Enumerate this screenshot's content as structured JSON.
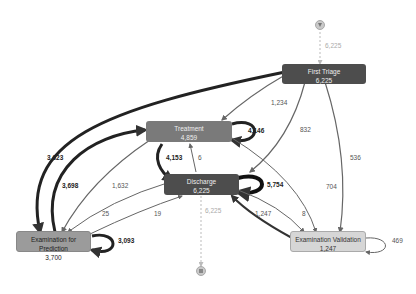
{
  "start": {
    "icon": "start-filter-icon",
    "count": "6,225"
  },
  "end": {
    "icon": "end-stop-icon",
    "count": "6,225"
  },
  "nodes": {
    "first_triage": {
      "label": "First Triage",
      "count": "6,225",
      "color": "#4d4d4d"
    },
    "treatment": {
      "label": "Treatment",
      "count": "4,859",
      "color": "#7a7a7a"
    },
    "discharge": {
      "label": "Discharge",
      "count": "6,225",
      "color": "#4d4d4d"
    },
    "exam_prediction": {
      "label": "Examination for Prediction",
      "count": "3,700",
      "color": "#9b9b9b"
    },
    "exam_validation": {
      "label": "Examination Validation",
      "count": "1,247",
      "color": "#d6d6d6"
    }
  },
  "edges": {
    "triage_to_treatment": "1,234",
    "triage_to_discharge": "832",
    "triage_to_validation": "536",
    "triage_to_prediction": "3,623",
    "treatment_self": "4,146",
    "treatment_to_discharge": "4,153",
    "discharge_to_treatment": "6",
    "discharge_self": "5,754",
    "prediction_to_treatment": "3,698",
    "treatment_to_prediction": "1,632",
    "discharge_to_prediction": "25",
    "prediction_to_discharge": "19",
    "treatment_to_validation": "704",
    "discharge_to_validation": "8",
    "validation_to_discharge": "1,247",
    "prediction_self": "3,093",
    "validation_self": "469"
  }
}
